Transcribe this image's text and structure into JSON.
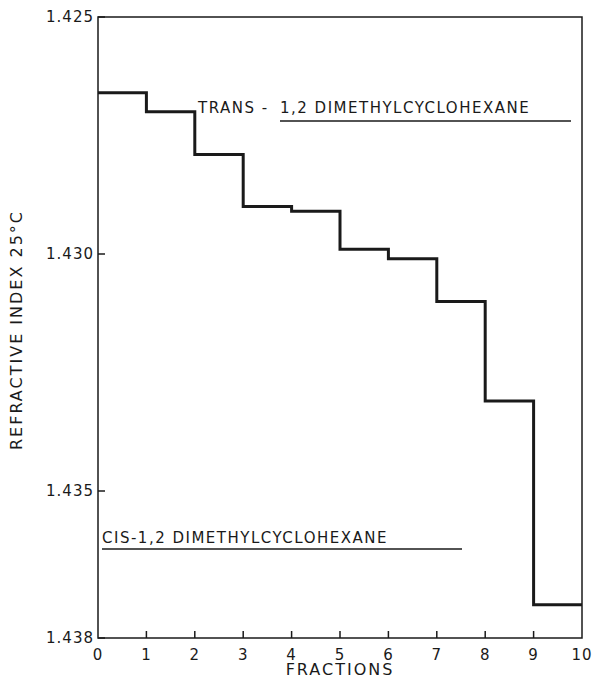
{
  "chart_data": {
    "type": "line",
    "style": "step",
    "title": "",
    "xlabel": "FRACTIONS",
    "ylabel": "REFRACTIVE INDEX 25°C",
    "xlim": [
      0,
      10
    ],
    "ylim": [
      1.438,
      1.425
    ],
    "y_inverted": true,
    "grid": false,
    "x_ticks": [
      0,
      1,
      2,
      3,
      4,
      5,
      6,
      7,
      8,
      9,
      10
    ],
    "x_tick_labels": [
      "0",
      "1",
      "2",
      "3",
      "4",
      "5",
      "6",
      "7",
      "8",
      "9",
      "10"
    ],
    "y_ticks": [
      1.425,
      1.43,
      1.435,
      1.438
    ],
    "y_tick_labels": [
      "1.425",
      "1.430",
      "1.435",
      "1.438"
    ],
    "series": [
      {
        "name": "Refractive index of fractions",
        "fractions": [
          "0-1",
          "1-2",
          "2-3",
          "3-4",
          "4-5",
          "5-6",
          "6-7",
          "7-8",
          "8-9",
          "9-10"
        ],
        "x_start": [
          0,
          1,
          2,
          3,
          4,
          5,
          6,
          7,
          8,
          9
        ],
        "x_end": [
          1,
          2,
          3,
          4,
          5,
          6,
          7,
          8,
          9,
          10
        ],
        "values": [
          1.4266,
          1.427,
          1.4279,
          1.429,
          1.4291,
          1.4299,
          1.4301,
          1.431,
          1.4331,
          1.4374
        ]
      }
    ],
    "annotations": [
      {
        "text": "TRANS-1,2 DIMETHYLCYCLOHEXANE",
        "prefix": "TRANS-",
        "underlined": "1,2 DIMETHYLCYCLOHEXANE",
        "reference_value": 1.427
      },
      {
        "text": "CIS-1,2 DIMETHYLCYCLOHEXANE",
        "underlined": "CIS-1,2 DIMETHYLCYCLOHEXANE",
        "reference_value": 1.4358
      }
    ],
    "legend": "none"
  },
  "labels": {
    "xlabel": "FRACTIONS",
    "ylabel": "REFRACTIVE INDEX  25°C",
    "trans_prefix": "TRANS -",
    "trans_name": "1,2 DIMETHYLCYCLOHEXANE",
    "cis_name": "CIS-1,2 DIMETHYLCYCLOHEXANE"
  }
}
